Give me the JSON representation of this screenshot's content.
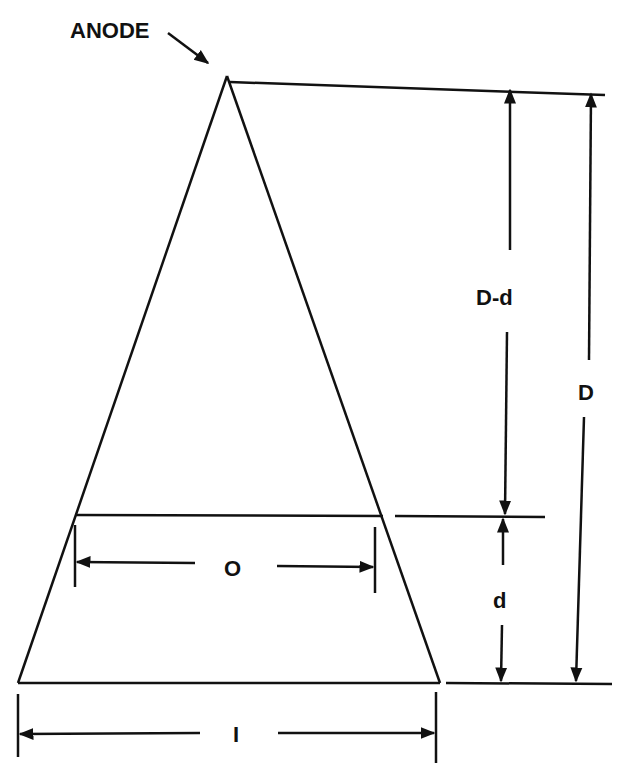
{
  "diagram": {
    "labels": {
      "anode": "ANODE",
      "d_minus_d": "D-d",
      "D": "D",
      "d": "d",
      "O": "O",
      "I": "I"
    },
    "colors": {
      "ink": "#111111",
      "background": "#ffffff"
    }
  }
}
